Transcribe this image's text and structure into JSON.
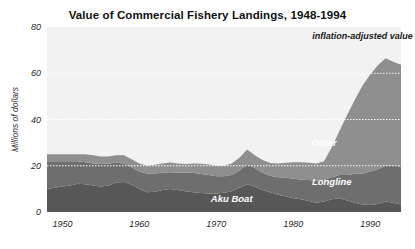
{
  "chart_data": {
    "type": "area",
    "title": "Value of Commercial Fishery Landings, 1948-1994",
    "xlabel": "",
    "ylabel": "Millions of dollars",
    "xlim": [
      1948,
      1994
    ],
    "ylim": [
      0,
      80
    ],
    "ytick_labels": [
      "0",
      "20",
      "40",
      "60",
      "80"
    ],
    "yticks": [
      0,
      20,
      40,
      60,
      80
    ],
    "xtick_labels": [
      "1950",
      "1960",
      "1970",
      "1980",
      "1990"
    ],
    "xticks": [
      1950,
      1960,
      1970,
      1980,
      1990
    ],
    "grid": true,
    "grid_style": "dotted-white-horizontal",
    "legend": "inline-labels",
    "stacked": true,
    "annotations": [
      {
        "text": "inflation-adjusted value",
        "x": 1989,
        "y": 75,
        "style": "dark-italic-bold"
      }
    ],
    "colors": {
      "plot_background": "#f2f2f2",
      "figure_background": "#ffffff",
      "aku_boat": "#575757",
      "longline": "#6e6e6e",
      "other": "#8f8f8f",
      "gridline": "#ffffff",
      "axis_text": "#2a2a2a",
      "title_text": "#111111"
    },
    "x": [
      1948,
      1949,
      1950,
      1951,
      1952,
      1953,
      1954,
      1955,
      1956,
      1957,
      1958,
      1959,
      1960,
      1961,
      1962,
      1963,
      1964,
      1965,
      1966,
      1967,
      1968,
      1969,
      1970,
      1971,
      1972,
      1973,
      1974,
      1975,
      1976,
      1977,
      1978,
      1979,
      1980,
      1981,
      1982,
      1983,
      1984,
      1985,
      1986,
      1987,
      1988,
      1989,
      1990,
      1991,
      1992,
      1993,
      1994
    ],
    "series": [
      {
        "name": "Aku Boat",
        "label_x": 1972,
        "label_y": 5.5,
        "values": [
          10.0,
          10.5,
          11.0,
          11.5,
          12.2,
          12.0,
          11.5,
          11.0,
          11.5,
          12.8,
          13.0,
          11.8,
          10.0,
          8.5,
          8.8,
          9.5,
          10.0,
          9.5,
          9.0,
          8.5,
          8.2,
          8.0,
          8.0,
          8.3,
          9.0,
          10.5,
          12.0,
          11.0,
          9.5,
          8.5,
          7.5,
          6.8,
          6.0,
          5.5,
          4.8,
          4.0,
          4.5,
          5.5,
          6.0,
          5.0,
          4.0,
          3.2,
          3.0,
          3.5,
          4.5,
          4.0,
          3.2
        ]
      },
      {
        "name": "Longline",
        "label_x": 1985,
        "label_y": 13,
        "values": [
          12.0,
          11.5,
          11.0,
          10.5,
          9.8,
          9.5,
          9.5,
          9.8,
          9.5,
          8.5,
          8.0,
          7.5,
          7.5,
          8.0,
          7.8,
          7.5,
          7.2,
          7.5,
          8.0,
          8.5,
          8.2,
          8.0,
          7.5,
          7.2,
          7.0,
          7.5,
          8.5,
          8.0,
          7.5,
          7.2,
          7.5,
          8.0,
          8.5,
          8.5,
          9.0,
          9.5,
          9.5,
          9.5,
          10.0,
          11.0,
          12.5,
          13.5,
          14.5,
          15.0,
          15.5,
          16.0,
          16.5
        ]
      },
      {
        "name": "Other",
        "label_x": 1984,
        "label_y": 30,
        "values": [
          3.0,
          3.0,
          3.0,
          3.0,
          3.0,
          3.5,
          3.5,
          3.2,
          3.0,
          3.2,
          3.5,
          3.5,
          3.5,
          3.5,
          3.8,
          4.0,
          4.2,
          4.0,
          3.8,
          4.0,
          4.5,
          4.5,
          4.5,
          4.5,
          5.0,
          5.5,
          6.5,
          5.5,
          5.5,
          5.5,
          6.0,
          6.5,
          7.0,
          7.5,
          7.5,
          7.5,
          8.0,
          13.0,
          19.0,
          26.0,
          32.0,
          38.0,
          42.0,
          45.0,
          46.5,
          45.0,
          44.0
        ]
      }
    ]
  }
}
